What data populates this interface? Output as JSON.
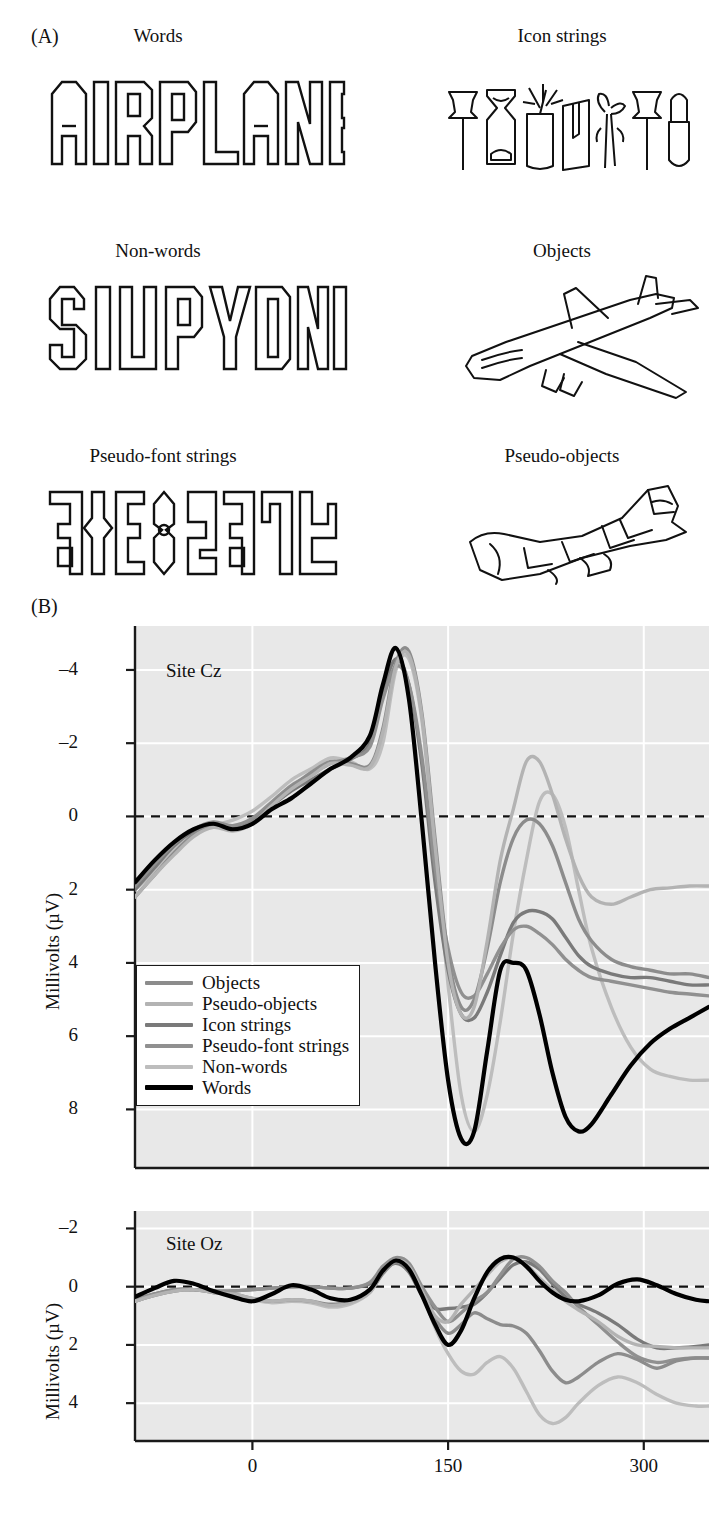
{
  "figure": {
    "panelA_label": "(A)",
    "panelB_label": "(B)"
  },
  "stimuli": [
    {
      "title": "Words",
      "art": "airplane-word",
      "text": "AIRPLANE"
    },
    {
      "title": "Icon strings",
      "art": "icon-strings",
      "text": ""
    },
    {
      "title": "Non-words",
      "art": "siupydnd-nonword",
      "text": "SIUPYDND"
    },
    {
      "title": "Objects",
      "art": "airplane-drawing",
      "text": ""
    },
    {
      "title": "Pseudo-font strings",
      "art": "pseudo-font-glyphs",
      "text": ""
    },
    {
      "title": "Pseudo-objects",
      "art": "pseudo-object-drawing",
      "text": ""
    }
  ],
  "legend": {
    "entries": [
      {
        "label": "Objects",
        "color": "#8c8c8c"
      },
      {
        "label": "Pseudo-objects",
        "color": "#b3b3b3"
      },
      {
        "label": "Icon strings",
        "color": "#7a7a7a"
      },
      {
        "label": "Pseudo-font strings",
        "color": "#909090"
      },
      {
        "label": "Non-words",
        "color": "#bdbdbd"
      },
      {
        "label": "Words",
        "color": "#000000"
      }
    ]
  },
  "chart_data": [
    {
      "type": "line",
      "title": "Site Cz",
      "xlabel": "",
      "ylabel": "Millivolts (µV)",
      "xlim": [
        -90,
        350
      ],
      "ylim": [
        -5.2,
        9.6
      ],
      "y_inverted": true,
      "xticks": [
        0,
        150,
        300
      ],
      "yticks": [
        -4,
        -2,
        0,
        2,
        4,
        6,
        8
      ],
      "grid": true,
      "zero_line": true,
      "legend_position": "inside-lower-left",
      "x": [
        -90,
        -75,
        -60,
        -45,
        -30,
        -15,
        0,
        15,
        30,
        45,
        60,
        75,
        90,
        100,
        110,
        120,
        130,
        140,
        150,
        160,
        170,
        180,
        190,
        200,
        210,
        220,
        230,
        240,
        250,
        260,
        275,
        290,
        305,
        320,
        335,
        350
      ],
      "series": [
        {
          "name": "Words",
          "color": "#000000",
          "values": [
            1.8,
            1.2,
            0.7,
            0.35,
            0.2,
            0.35,
            0.2,
            -0.2,
            -0.5,
            -0.9,
            -1.3,
            -1.6,
            -2.2,
            -3.6,
            -4.6,
            -3.2,
            0.2,
            4.0,
            7.2,
            8.8,
            8.6,
            6.4,
            4.2,
            4.0,
            4.2,
            5.4,
            7.0,
            8.2,
            8.6,
            8.4,
            7.6,
            6.8,
            6.2,
            5.8,
            5.5,
            5.2
          ]
        },
        {
          "name": "Non-words",
          "color": "#bdbdbd",
          "values": [
            2.0,
            1.5,
            0.9,
            0.5,
            0.25,
            0.1,
            -0.15,
            -0.55,
            -1.0,
            -1.3,
            -1.6,
            -1.5,
            -1.3,
            -2.0,
            -4.0,
            -4.3,
            -2.6,
            1.0,
            4.6,
            7.6,
            8.6,
            7.6,
            5.6,
            3.2,
            1.2,
            -0.4,
            -0.6,
            0.3,
            2.0,
            3.6,
            5.2,
            6.3,
            6.9,
            7.1,
            7.2,
            7.2
          ]
        },
        {
          "name": "Icon strings",
          "color": "#7a7a7a",
          "values": [
            2.0,
            1.4,
            0.8,
            0.4,
            0.2,
            0.3,
            0.1,
            -0.3,
            -0.7,
            -1.0,
            -1.3,
            -1.55,
            -2.0,
            -3.4,
            -4.3,
            -3.6,
            -1.4,
            1.8,
            4.2,
            5.4,
            5.5,
            4.8,
            3.8,
            2.9,
            2.6,
            2.6,
            2.8,
            3.3,
            3.8,
            4.1,
            4.3,
            4.4,
            4.4,
            4.5,
            4.6,
            4.6
          ]
        },
        {
          "name": "Pseudo-font strings",
          "color": "#909090",
          "values": [
            1.9,
            1.3,
            0.75,
            0.35,
            0.15,
            0.25,
            0.05,
            -0.4,
            -0.85,
            -1.15,
            -1.45,
            -1.6,
            -1.9,
            -3.2,
            -4.1,
            -3.6,
            -1.6,
            1.4,
            3.6,
            4.8,
            4.9,
            4.3,
            3.6,
            3.1,
            3.0,
            3.2,
            3.5,
            3.9,
            4.2,
            4.4,
            4.5,
            4.6,
            4.7,
            4.8,
            4.85,
            4.9
          ]
        },
        {
          "name": "Objects",
          "color": "#8c8c8c",
          "values": [
            2.2,
            1.6,
            1.0,
            0.5,
            0.25,
            0.35,
            0.15,
            -0.35,
            -0.8,
            -1.2,
            -1.5,
            -1.45,
            -1.4,
            -2.4,
            -4.2,
            -4.5,
            -2.8,
            0.6,
            3.8,
            5.2,
            5.0,
            3.6,
            1.8,
            0.6,
            0.1,
            0.2,
            0.8,
            1.8,
            2.8,
            3.4,
            3.9,
            4.1,
            4.2,
            4.3,
            4.3,
            4.4
          ]
        },
        {
          "name": "Pseudo-objects",
          "color": "#b3b3b3",
          "values": [
            2.2,
            1.6,
            1.05,
            0.55,
            0.3,
            0.4,
            0.2,
            -0.3,
            -0.75,
            -1.1,
            -1.45,
            -1.4,
            -1.35,
            -2.3,
            -4.1,
            -4.4,
            -2.7,
            0.8,
            4.0,
            5.4,
            5.2,
            3.4,
            1.2,
            -0.2,
            -1.5,
            -1.5,
            -0.6,
            0.6,
            1.6,
            2.2,
            2.4,
            2.2,
            2.0,
            1.95,
            1.9,
            1.9
          ]
        }
      ]
    },
    {
      "type": "line",
      "title": "Site Oz",
      "xlabel": "",
      "ylabel": "Millivolts (µV)",
      "xlim": [
        -90,
        350
      ],
      "ylim": [
        -2.6,
        5.3
      ],
      "y_inverted": true,
      "xticks": [
        0,
        150,
        300
      ],
      "yticks": [
        -2,
        0,
        2,
        4
      ],
      "grid": true,
      "zero_line": true,
      "legend_position": "none",
      "x": [
        -90,
        -75,
        -60,
        -45,
        -30,
        -15,
        0,
        15,
        30,
        45,
        60,
        75,
        90,
        100,
        110,
        120,
        130,
        140,
        150,
        160,
        170,
        180,
        190,
        200,
        210,
        220,
        230,
        240,
        250,
        265,
        280,
        295,
        310,
        325,
        340,
        350
      ],
      "series": [
        {
          "name": "Words",
          "color": "#000000",
          "values": [
            0.35,
            0.05,
            -0.2,
            -0.1,
            0.15,
            0.35,
            0.5,
            0.25,
            -0.05,
            0.1,
            0.4,
            0.45,
            0.1,
            -0.55,
            -0.9,
            -0.6,
            0.3,
            1.3,
            2.0,
            1.5,
            0.4,
            -0.5,
            -0.95,
            -1.0,
            -0.7,
            -0.2,
            0.2,
            0.45,
            0.5,
            0.3,
            -0.1,
            -0.25,
            -0.05,
            0.25,
            0.45,
            0.5
          ]
        },
        {
          "name": "Non-words",
          "color": "#bdbdbd",
          "values": [
            0.5,
            0.3,
            0.15,
            0.1,
            0.2,
            0.3,
            0.45,
            0.55,
            0.5,
            0.55,
            0.7,
            0.6,
            0.2,
            -0.5,
            -0.95,
            -0.8,
            0.2,
            1.4,
            2.3,
            2.9,
            3.0,
            2.6,
            2.4,
            2.8,
            3.6,
            4.4,
            4.7,
            4.5,
            4.0,
            3.4,
            3.1,
            3.3,
            3.7,
            4.0,
            4.1,
            4.1
          ]
        },
        {
          "name": "Icon strings",
          "color": "#7a7a7a",
          "values": [
            0.45,
            0.25,
            0.1,
            0.1,
            0.15,
            0.15,
            0.1,
            0.05,
            0.0,
            0.0,
            0.05,
            0.05,
            -0.1,
            -0.55,
            -0.8,
            -0.5,
            0.3,
            0.75,
            0.75,
            0.7,
            0.6,
            0.2,
            -0.3,
            -0.75,
            -0.85,
            -0.6,
            -0.1,
            0.35,
            0.6,
            0.9,
            1.3,
            1.8,
            2.1,
            2.1,
            2.05,
            2.0
          ]
        },
        {
          "name": "Pseudo-font strings",
          "color": "#909090",
          "values": [
            0.45,
            0.25,
            0.1,
            0.1,
            0.15,
            0.15,
            0.1,
            0.05,
            0.0,
            0.0,
            0.05,
            0.05,
            -0.15,
            -0.7,
            -1.0,
            -0.8,
            0.0,
            0.7,
            1.2,
            0.9,
            0.5,
            0.2,
            -0.4,
            -0.95,
            -1.0,
            -0.7,
            -0.2,
            0.2,
            0.7,
            1.3,
            1.9,
            2.4,
            2.6,
            2.5,
            2.45,
            2.45
          ]
        },
        {
          "name": "Objects",
          "color": "#8c8c8c",
          "values": [
            0.5,
            0.3,
            0.15,
            0.1,
            0.2,
            0.25,
            0.4,
            0.5,
            0.45,
            0.5,
            0.6,
            0.5,
            0.15,
            -0.45,
            -0.85,
            -0.6,
            0.3,
            1.1,
            1.6,
            1.3,
            0.9,
            1.1,
            1.3,
            1.35,
            1.6,
            2.2,
            2.9,
            3.3,
            3.1,
            2.6,
            2.3,
            2.5,
            2.8,
            2.55,
            2.45,
            2.45
          ]
        },
        {
          "name": "Pseudo-objects",
          "color": "#b3b3b3",
          "values": [
            0.5,
            0.3,
            0.15,
            0.1,
            0.2,
            0.25,
            0.4,
            0.5,
            0.45,
            0.5,
            0.65,
            0.55,
            0.2,
            -0.55,
            -0.9,
            -0.7,
            0.15,
            1.0,
            1.2,
            0.6,
            0.1,
            -0.4,
            -0.85,
            -1.0,
            -0.75,
            -0.3,
            0.1,
            0.5,
            0.8,
            1.2,
            1.7,
            2.0,
            2.05,
            2.1,
            2.1,
            2.1
          ]
        }
      ]
    }
  ]
}
